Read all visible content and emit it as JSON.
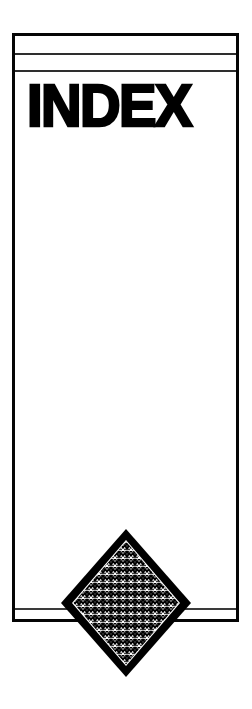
{
  "page": {
    "background_color": "#ffffff",
    "width": 252,
    "height": 709
  },
  "card": {
    "border_color": "#050505",
    "fill_color": "#ffffff",
    "rules": [
      {
        "name": "top-rule-1",
        "color": "#2e2e2e"
      },
      {
        "name": "top-rule-2",
        "color": "#2e2e2e"
      },
      {
        "name": "bottom-rule",
        "color": "#3a3a3a"
      }
    ]
  },
  "header": {
    "title": "INDEX",
    "title_color": "#000000"
  },
  "body": {
    "content": ""
  },
  "emblem": {
    "name": "diamond-emblem",
    "shape": "diamond",
    "outline_color": "#000000",
    "pattern": "zigzag-chevron-halftone",
    "pattern_color": "#000000",
    "pattern_background": "#ffffff",
    "label": "Diamond zigzag emblem"
  }
}
